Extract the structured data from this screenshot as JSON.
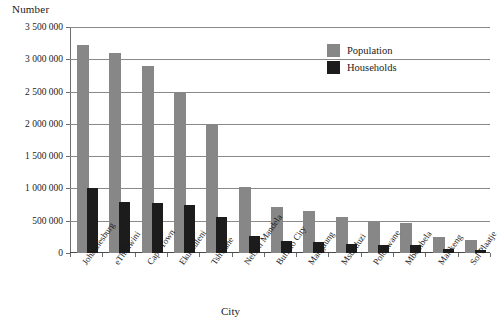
{
  "chart_data": {
    "type": "bar",
    "title": "",
    "xlabel": "City",
    "ylabel": "Number",
    "ylim": [
      0,
      3500000
    ],
    "ytick_labels": [
      "3 500 000",
      "3 000 000",
      "2 500 000",
      "2 000 000",
      "1 500 000",
      "1 000 000",
      "500 000",
      "0"
    ],
    "ytick_values": [
      3500000,
      3000000,
      2500000,
      2000000,
      1500000,
      1000000,
      500000,
      0
    ],
    "grid": true,
    "legend_position": "top-right",
    "categories": [
      "Johannesburg",
      "eThekwini",
      "Cape Town",
      "Ekurhuleni",
      "Tshwane",
      "Nelson Mandela",
      "Buffalo City",
      "Mangaung",
      "Msunduzi",
      "Polokwane",
      "Mbombela",
      "Mafikeng",
      "Sol Plaatje"
    ],
    "series": [
      {
        "name": "Population",
        "color": "#878787",
        "values": [
          3225000,
          3100000,
          2900000,
          2500000,
          2000000,
          1025000,
          710000,
          650000,
          555000,
          500000,
          465000,
          250000,
          200000
        ]
      },
      {
        "name": "Households",
        "color": "#1c1c1c",
        "values": [
          1010000,
          790000,
          770000,
          745000,
          560000,
          260000,
          180000,
          175000,
          135000,
          125000,
          120000,
          65000,
          50000
        ]
      }
    ]
  },
  "legend": {
    "items": [
      {
        "label": "Population",
        "swatch": "population"
      },
      {
        "label": "Households",
        "swatch": "households"
      }
    ]
  }
}
